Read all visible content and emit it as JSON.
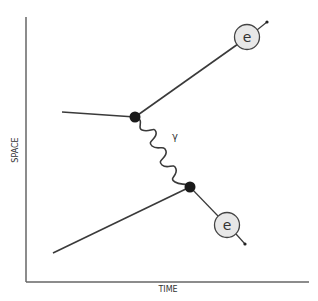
{
  "diagram": {
    "axes": {
      "x_label": "TIME",
      "y_label": "SPACE"
    },
    "particles": {
      "electron_top_label": "e",
      "electron_bottom_label": "e",
      "photon_label": "γ"
    },
    "colors": {
      "line": "#3a3a3a",
      "vertex": "#1a1a1a",
      "circle_fill": "#e8e8e8",
      "axis": "#555555"
    }
  }
}
